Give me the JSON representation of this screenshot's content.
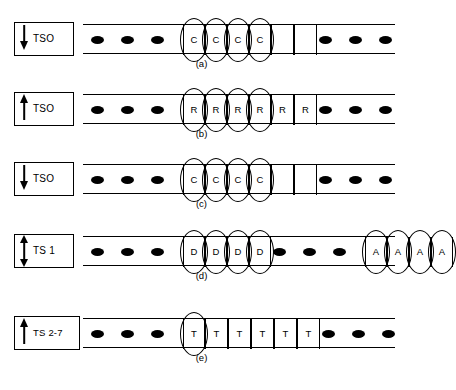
{
  "diagram": {
    "rows": [
      {
        "id": "a",
        "caption": "(a)",
        "label": "TSO",
        "arrow": "down",
        "arrow_icon": "arrow-down-icon",
        "lead_dots": 3,
        "trail_dots": 3,
        "cells": [
          {
            "text": "C",
            "circled": true
          },
          {
            "text": "C",
            "circled": true
          },
          {
            "text": "C",
            "circled": true
          },
          {
            "text": "C",
            "circled": true
          },
          {
            "text": "",
            "circled": false
          },
          {
            "text": "",
            "circled": false
          }
        ]
      },
      {
        "id": "b",
        "caption": "(b)",
        "label": "TSO",
        "arrow": "up",
        "arrow_icon": "arrow-up-icon",
        "lead_dots": 3,
        "trail_dots": 3,
        "cells": [
          {
            "text": "R",
            "circled": true
          },
          {
            "text": "R",
            "circled": true
          },
          {
            "text": "R",
            "circled": true
          },
          {
            "text": "R",
            "circled": true
          },
          {
            "text": "R",
            "circled": false
          },
          {
            "text": "R",
            "circled": false
          }
        ]
      },
      {
        "id": "c",
        "caption": "(c)",
        "label": "TSO",
        "arrow": "down",
        "arrow_icon": "arrow-down-icon",
        "lead_dots": 3,
        "trail_dots": 3,
        "cells": [
          {
            "text": "C",
            "circled": true
          },
          {
            "text": "C",
            "circled": true
          },
          {
            "text": "C",
            "circled": true
          },
          {
            "text": "C",
            "circled": true
          },
          {
            "text": "",
            "circled": false
          },
          {
            "text": "",
            "circled": false
          }
        ]
      },
      {
        "id": "d",
        "caption": "(d)",
        "label": "TS 1",
        "arrow": "both",
        "arrow_icon": "arrow-up-down-icon",
        "lead_dots": 3,
        "mid_dots": 3,
        "trail_dots": 0,
        "cells": [
          {
            "text": "D",
            "circled": true
          },
          {
            "text": "D",
            "circled": true
          },
          {
            "text": "D",
            "circled": true
          },
          {
            "text": "D",
            "circled": true
          }
        ],
        "cells2": [
          {
            "text": "A",
            "circled": true
          },
          {
            "text": "A",
            "circled": true
          },
          {
            "text": "A",
            "circled": true
          },
          {
            "text": "A",
            "circled": true
          }
        ]
      },
      {
        "id": "e",
        "caption": "(e)",
        "label": "TS 2-7",
        "arrow": "up",
        "arrow_icon": "arrow-up-icon",
        "lead_dots": 3,
        "trail_dots": 3,
        "cells": [
          {
            "text": "T",
            "circled": true
          },
          {
            "text": "T",
            "circled": false
          },
          {
            "text": "T",
            "circled": false
          },
          {
            "text": "T",
            "circled": false
          },
          {
            "text": "T",
            "circled": false
          },
          {
            "text": "T",
            "circled": false
          }
        ]
      }
    ]
  }
}
